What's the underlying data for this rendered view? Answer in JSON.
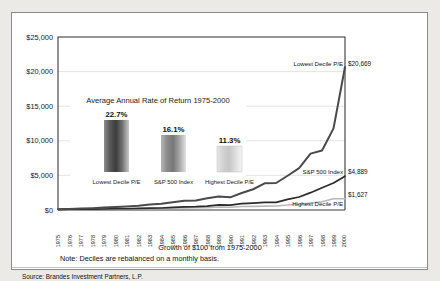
{
  "chart_data": {
    "type": "line",
    "title": "Growth of $100 from 1975-2000",
    "xlabel": "",
    "ylabel": "",
    "ylim": [
      0,
      25000
    ],
    "grid": true,
    "legend_position": "end-of-line labels",
    "x": [
      1975,
      1976,
      1977,
      1978,
      1979,
      1980,
      1981,
      1982,
      1983,
      1984,
      1985,
      1986,
      1987,
      1988,
      1989,
      1990,
      1991,
      1992,
      1993,
      1994,
      1995,
      1996,
      1997,
      1998,
      1999,
      2000
    ],
    "categories": [
      "1975",
      "1976",
      "1977",
      "1978",
      "1979",
      "1980",
      "1981",
      "1982",
      "1983",
      "1984",
      "1985",
      "1986",
      "1987",
      "1988",
      "1989",
      "1990",
      "1991",
      "1992",
      "1993",
      "1994",
      "1995",
      "1996",
      "1997",
      "1998",
      "1999",
      "2000"
    ],
    "series": [
      {
        "name": "Lowest Decile P/E",
        "end_label": "$20,669",
        "end_value": 20669,
        "color": "#4a4a4a",
        "values": [
          100,
          155,
          205,
          260,
          345,
          430,
          520,
          610,
          800,
          900,
          1120,
          1330,
          1380,
          1700,
          1960,
          1830,
          2450,
          3000,
          3850,
          3900,
          4950,
          6050,
          8150,
          8600,
          11800,
          20669
        ]
      },
      {
        "name": "S&P 500 Index",
        "end_label": "$4,889",
        "end_value": 4889,
        "color": "#2b2b2b",
        "values": [
          100,
          124,
          115,
          123,
          146,
          193,
          184,
          223,
          273,
          290,
          382,
          453,
          477,
          556,
          732,
          709,
          925,
          995,
          1095,
          1110,
          1527,
          1878,
          2504,
          3220,
          3897,
          4889
        ]
      },
      {
        "name": "Highest Decile P/E",
        "end_label": "$1,627",
        "end_value": 1627,
        "color": "#b9b9b9",
        "values": [
          100,
          118,
          112,
          118,
          136,
          170,
          160,
          180,
          215,
          220,
          270,
          310,
          320,
          350,
          430,
          400,
          500,
          520,
          560,
          570,
          720,
          840,
          1010,
          1180,
          1620,
          1627
        ]
      }
    ],
    "yticks": [
      "$0",
      "$5,000",
      "$10,000",
      "$15,000",
      "$20,000",
      "$25,000"
    ],
    "ytick_values": [
      0,
      5000,
      10000,
      15000,
      20000,
      25000
    ],
    "inset": {
      "type": "bar",
      "title": "Average Annual Rate of Return 1975-2000",
      "categories": [
        "Lowest Decile P/E",
        "S&P 500 Index",
        "Highest Decile P/E"
      ],
      "values": [
        22.7,
        16.1,
        11.3
      ],
      "value_labels": [
        "22.7%",
        "16.1%",
        "11.3%"
      ]
    },
    "note": "Note: Deciles are rebalanced on a monthly basis.",
    "source": "Source: Brandes Investment Partners, L.P."
  }
}
